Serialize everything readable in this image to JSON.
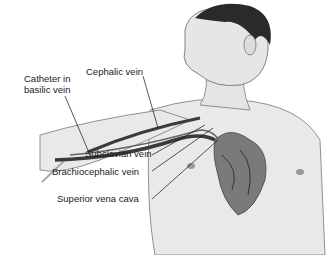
{
  "diagram": {
    "labels": {
      "catheter_line1": "Catheter in",
      "catheter_line2": "basilic vein",
      "cephalic": "Cephalic vein",
      "subclavian": "Subclavian vein",
      "brachiocephalic": "Brachiocephalic vein",
      "svc": "Superior vena cava"
    },
    "colors": {
      "skin": "#e6e6e6",
      "outline": "#555555",
      "vein": "#3a3a3a",
      "heart": "#7a7a7a",
      "hair": "#2a2a2a"
    }
  }
}
